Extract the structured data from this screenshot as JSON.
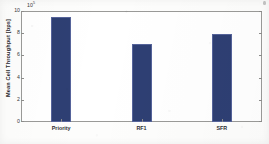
{
  "chart_data": {
    "type": "bar",
    "title": "",
    "xlabel": "",
    "ylabel": "Mean Cell Throughput [bps]",
    "categories": [
      "Priority",
      "RF1",
      "SFR"
    ],
    "values": [
      945000,
      700000,
      790000
    ],
    "ylim": [
      0,
      1000000
    ],
    "y_tick_values": [
      0,
      200000,
      400000,
      600000,
      800000,
      1000000
    ],
    "y_tick_labels": [
      "0",
      "2",
      "4",
      "6",
      "8",
      "10"
    ],
    "y_axis_multiplier_base": "10",
    "y_axis_multiplier_exponent": "5",
    "y_axis_multiplier_text": "x 10",
    "grid": false,
    "legend": null,
    "bar_color": "#2e3f73",
    "bar_edge_color": "#55639a",
    "axes_color": "#9a9a98",
    "background_color": "#ffffff"
  },
  "figure": {
    "y_axis_title": "Mean Cell Throughput [bps]",
    "exponent_base": "10",
    "exponent_power": "5"
  }
}
